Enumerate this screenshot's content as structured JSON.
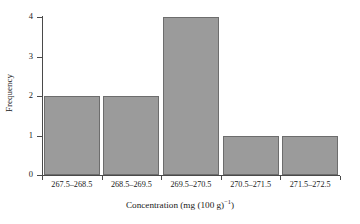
{
  "chart_data": {
    "type": "bar",
    "title": "",
    "xlabel": "Concentration (mg (100 g)−1)",
    "xlabel_base": "Concentration (mg (100 g)",
    "xlabel_sup": "−1",
    "xlabel_tail": ")",
    "ylabel": "Frequency",
    "categories": [
      "267.5–268.5",
      "268.5–269.5",
      "269.5–270.5",
      "270.5–271.5",
      "271.5–272.5"
    ],
    "values": [
      2,
      2,
      4,
      1,
      1
    ],
    "ylim": [
      0,
      4
    ],
    "yticks": [
      "0",
      "1",
      "2",
      "3",
      "4"
    ],
    "ytick_values": [
      0,
      1,
      2,
      3,
      4
    ],
    "grid": false,
    "legend": false,
    "bar_fill": "#9b9b9b",
    "bar_edge": "#6d6d6d",
    "axis_color": "#4a4a4a",
    "background": "#ffffff"
  }
}
